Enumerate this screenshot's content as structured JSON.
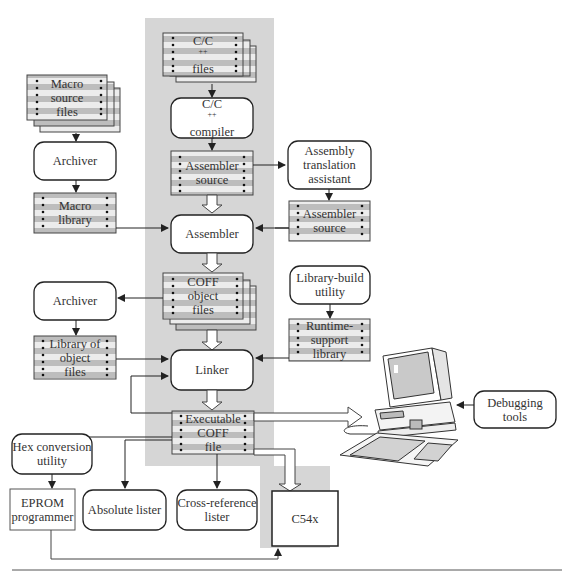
{
  "diagram": {
    "colors": {
      "shaded_panel": "#d4d4d4",
      "box_border": "#222222",
      "file_stripe_gray": "#b8b8b8",
      "file_stripe_light": "#e8e8e8",
      "text": "#333333"
    },
    "nodes": {
      "c_files": {
        "type": "file-stack",
        "lines": [
          "C/C",
          "files"
        ],
        "sup": "++"
      },
      "c_compiler": {
        "type": "process",
        "lines": [
          "C/C",
          "compiler"
        ],
        "sup": "++"
      },
      "asm_source_main": {
        "type": "file",
        "lines": [
          "Assembler",
          "source"
        ]
      },
      "asm_translation": {
        "type": "process",
        "lines": [
          "Assembly",
          "translation",
          "assistant"
        ]
      },
      "asm_source_side": {
        "type": "file",
        "lines": [
          "Assembler",
          "source"
        ]
      },
      "macro_source": {
        "type": "file-stack",
        "lines": [
          "Macro",
          "source",
          "files"
        ]
      },
      "archiver_top": {
        "type": "process",
        "lines": [
          "Archiver"
        ]
      },
      "macro_library": {
        "type": "file",
        "lines": [
          "Macro",
          "library"
        ]
      },
      "assembler": {
        "type": "process",
        "lines": [
          "Assembler"
        ]
      },
      "coff_objects": {
        "type": "file-stack",
        "lines": [
          "COFF",
          "object",
          "files"
        ]
      },
      "library_build": {
        "type": "process",
        "lines": [
          "Library-build",
          "utility"
        ]
      },
      "runtime_support": {
        "type": "file",
        "lines": [
          "Runtime-",
          "support",
          "library"
        ]
      },
      "archiver_bottom": {
        "type": "process",
        "lines": [
          "Archiver"
        ]
      },
      "library_objects": {
        "type": "file",
        "lines": [
          "Library of",
          "object",
          "files"
        ]
      },
      "linker": {
        "type": "process",
        "lines": [
          "Linker"
        ]
      },
      "executable_coff": {
        "type": "file",
        "lines": [
          "Executable",
          "COFF",
          "file"
        ]
      },
      "debugging_tools": {
        "type": "process",
        "lines": [
          "Debugging",
          "tools"
        ]
      },
      "hex_conversion": {
        "type": "process",
        "lines": [
          "Hex conversion",
          "utility"
        ]
      },
      "eprom_programmer": {
        "type": "device",
        "lines": [
          "EPROM",
          "programmer"
        ]
      },
      "absolute_lister": {
        "type": "process",
        "lines": [
          "Absolute lister"
        ]
      },
      "cross_reference": {
        "type": "process",
        "lines": [
          "Cross-reference",
          "lister"
        ]
      },
      "c54x": {
        "type": "device",
        "lines": [
          "C54x"
        ]
      },
      "computer": {
        "type": "illustration",
        "lines": []
      }
    }
  }
}
